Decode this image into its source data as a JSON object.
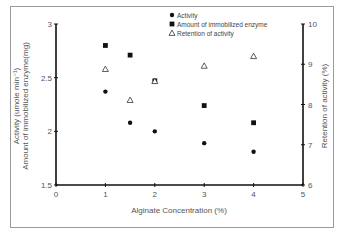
{
  "chart_data": {
    "type": "scatter",
    "title": "",
    "xlabel": "Alginate Concentration (%)",
    "ylabel_left": [
      "Activity (umole min⁻¹)",
      "Amount of immobilized enzyme(mg)"
    ],
    "ylabel_right": "Retention of activity (%)",
    "xlim": [
      0,
      5
    ],
    "ylim_left": [
      1.5,
      3
    ],
    "ylim_right": [
      6,
      10
    ],
    "x_ticks": [
      "0",
      "1",
      "2",
      "3",
      "4",
      "5"
    ],
    "y_ticks_left": [
      "1.5",
      "2",
      "2.5",
      "3"
    ],
    "y_ticks_right": [
      "6",
      "7",
      "8",
      "9",
      "10"
    ],
    "grid": false,
    "legend_position": "top-right",
    "series": [
      {
        "name": "Activity",
        "marker": "circle",
        "axis": "left",
        "x": [
          1,
          1.5,
          2,
          3,
          4
        ],
        "values": [
          2.37,
          2.08,
          2.0,
          1.89,
          1.81
        ]
      },
      {
        "name": "Amount of immobilized enzyme",
        "marker": "square",
        "axis": "left",
        "x": [
          1,
          1.5,
          2,
          3,
          4
        ],
        "values": [
          2.8,
          2.71,
          2.47,
          2.24,
          2.08
        ]
      },
      {
        "name": "Retention of activity",
        "marker": "triangle-open",
        "axis": "right",
        "x": [
          1,
          1.5,
          2,
          3,
          4
        ],
        "values": [
          8.88,
          8.11,
          8.58,
          8.96,
          9.2
        ]
      }
    ]
  },
  "labels": {
    "x_axis": "Alginate Concentration (%)",
    "y_left_1": "Activity (umole min⁻¹)",
    "y_left_2": "Amount of immobilized enzyme(mg)",
    "y_right": "Retention of activity (%)",
    "legend": [
      "Activity",
      "Amount of immobilized enzyme",
      "Retention of activity"
    ]
  }
}
